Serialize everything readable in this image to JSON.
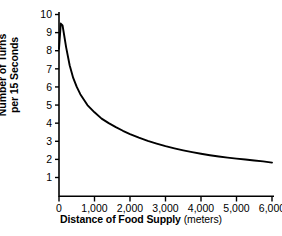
{
  "chart_data": {
    "type": "line",
    "title": "",
    "xlabel": "Distance of Food Supply",
    "xunits": "(meters)",
    "ylabel_line1": "Number of Turns",
    "ylabel_line2": "per 15 Seconds",
    "xlim": [
      0,
      6000
    ],
    "ylim": [
      0,
      10
    ],
    "grid": false,
    "legend": "none",
    "xticks": [
      0,
      1000,
      2000,
      3000,
      4000,
      5000,
      6000
    ],
    "xticklabels": [
      "0",
      "1,000",
      "2,000",
      "3,000",
      "4,000",
      "5,000",
      "6,000"
    ],
    "yticks": [
      1,
      2,
      3,
      4,
      5,
      6,
      7,
      8,
      9,
      10
    ],
    "yticklabels": [
      "1",
      "2",
      "3",
      "4",
      "5",
      "6",
      "7",
      "8",
      "9",
      "10"
    ],
    "line_color": "#000000",
    "series": [
      {
        "name": "Turns per 15 seconds",
        "x": [
          0,
          50,
          100,
          150,
          200,
          300,
          400,
          500,
          600,
          800,
          1000,
          1200,
          1400,
          1600,
          1800,
          2000,
          2250,
          2500,
          2750,
          3000,
          3250,
          3500,
          3750,
          4000,
          4250,
          4500,
          4750,
          5000,
          5250,
          5500,
          5750,
          6000
        ],
        "values": [
          8.1,
          9.5,
          9.4,
          8.8,
          8.2,
          7.2,
          6.5,
          6.0,
          5.6,
          5.0,
          4.6,
          4.25,
          4.0,
          3.78,
          3.58,
          3.4,
          3.2,
          3.02,
          2.87,
          2.73,
          2.61,
          2.5,
          2.4,
          2.31,
          2.23,
          2.16,
          2.1,
          2.04,
          1.99,
          1.94,
          1.89,
          1.82
        ]
      }
    ]
  }
}
